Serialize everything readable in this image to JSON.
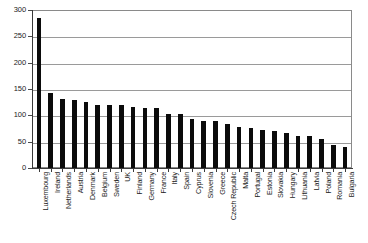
{
  "chart_data": {
    "type": "bar",
    "title": "",
    "xlabel": "",
    "ylabel": "",
    "ylim": [
      0,
      300
    ],
    "yticks": [
      0,
      50,
      100,
      150,
      200,
      250,
      300
    ],
    "ytick_labels": [
      "0",
      "50",
      "100",
      "150",
      "200",
      "250",
      "300"
    ],
    "grid": true,
    "legend": "none",
    "categories": [
      "Luxembourg",
      "Ireland",
      "Netherlands",
      "Austria",
      "Denmark",
      "Belgium",
      "Sweden",
      "UK",
      "Finland",
      "Germany",
      "France",
      "Italy",
      "Spain",
      "Cyprus",
      "Slovenia",
      "Greece",
      "Czech Republic",
      "Malta",
      "Portugal",
      "Estonia",
      "Slovakia",
      "Hungary",
      "Lithuania",
      "Latvia",
      "Poland",
      "Romania",
      "Bulgaria"
    ],
    "values": [
      287,
      144,
      132,
      130,
      127,
      121,
      121,
      120,
      117,
      115,
      114,
      104,
      103,
      94,
      89,
      89,
      84,
      79,
      76,
      73,
      70,
      66,
      62,
      62,
      56,
      44,
      41
    ]
  }
}
